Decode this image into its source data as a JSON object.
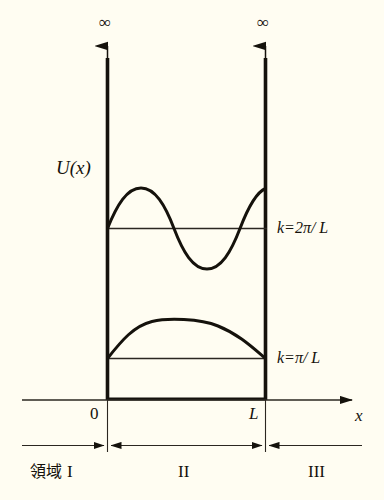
{
  "figure": {
    "type": "diagram",
    "background_color": "#fffdf2",
    "ink_color": "#15120c",
    "potential_label": "U(x)",
    "axis": {
      "x_label": "x",
      "origin_label": "0",
      "width_label": "L"
    },
    "walls": [
      {
        "name": "left-wall",
        "top_label": "∞",
        "x_tick_label": "0"
      },
      {
        "name": "right-wall",
        "top_label": "∞",
        "x_tick_label": "L"
      }
    ],
    "energy_levels": [
      {
        "name": "level-n2",
        "k_label": "k=2π/ L",
        "k_value_text": "2π/L",
        "nodes": 1,
        "half_wavelengths": 2
      },
      {
        "name": "level-n1",
        "k_label": "k=π/ L",
        "k_value_text": "π/L",
        "nodes": 0,
        "half_wavelengths": 1
      }
    ],
    "regions": [
      {
        "name": "region-1",
        "prefix": "領域",
        "numeral": "I"
      },
      {
        "name": "region-2",
        "prefix": "",
        "numeral": "II"
      },
      {
        "name": "region-3",
        "prefix": "",
        "numeral": "III"
      }
    ]
  }
}
